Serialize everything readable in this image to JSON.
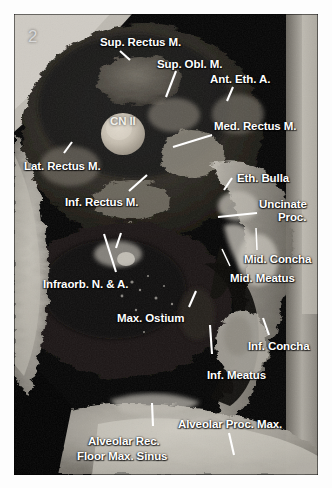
{
  "figure": {
    "number": "2",
    "caption_text": "",
    "plate": {
      "left": 14,
      "top": 14,
      "width": 304,
      "height": 461,
      "background_color": "#000000",
      "border_color": "#ffffff"
    }
  },
  "colors": {
    "label_text": "#ffffff",
    "leader_line": "#ffffff",
    "figure_number": "#d8d8d8",
    "page_background": "#ffffff",
    "dark_cavity": "#000000",
    "bone_light": "#c9c5bc",
    "soft_tissue_mid": "#6b6760",
    "optic_nerve": "#cfc8bb"
  },
  "labels": [
    {
      "id": "sup-rectus-m",
      "text": "Sup. Rectus M.",
      "x": 100,
      "y": 36,
      "align": "left"
    },
    {
      "id": "sup-obl-m",
      "text": "Sup. Obl. M.",
      "x": 157,
      "y": 58,
      "align": "left"
    },
    {
      "id": "ant-eth-a",
      "text": "Ant. Eth. A.",
      "x": 210,
      "y": 73,
      "align": "left"
    },
    {
      "id": "cn-ii",
      "text": "CN II",
      "x": 110,
      "y": 115,
      "align": "left"
    },
    {
      "id": "med-rectus-m",
      "text": "Med. Rectus M.",
      "x": 214,
      "y": 120,
      "align": "left"
    },
    {
      "id": "lat-rectus-m",
      "text": "Lat. Rectus M.",
      "x": 24,
      "y": 160,
      "align": "left"
    },
    {
      "id": "eth-bulla",
      "text": "Eth. Bulla",
      "x": 237,
      "y": 172,
      "align": "left"
    },
    {
      "id": "inf-rectus-m",
      "text": "Inf. Rectus M.",
      "x": 65,
      "y": 196,
      "align": "left"
    },
    {
      "id": "uncinate",
      "text": "Uncinate",
      "x": 259,
      "y": 198,
      "align": "left"
    },
    {
      "id": "proc",
      "text": "Proc.",
      "x": 278,
      "y": 211,
      "align": "left"
    },
    {
      "id": "mid-concha",
      "text": "Mid. Concha",
      "x": 244,
      "y": 253,
      "align": "left"
    },
    {
      "id": "mid-meatus",
      "text": "Mid. Meatus",
      "x": 230,
      "y": 272,
      "align": "left"
    },
    {
      "id": "infraorb-n-a",
      "text": "Infraorb. N. & A.",
      "x": 43,
      "y": 278,
      "align": "left"
    },
    {
      "id": "max-ostium",
      "text": "Max. Ostium",
      "x": 117,
      "y": 312,
      "align": "left"
    },
    {
      "id": "inf-concha",
      "text": "Inf. Concha",
      "x": 248,
      "y": 340,
      "align": "left"
    },
    {
      "id": "inf-meatus",
      "text": "Inf. Meatus",
      "x": 207,
      "y": 369,
      "align": "left"
    },
    {
      "id": "alveolar-proc-max",
      "text": "Alveolar Proc. Max.",
      "x": 178,
      "y": 418,
      "align": "left"
    },
    {
      "id": "alveolar-rec",
      "text": "Alveolar Rec.",
      "x": 88,
      "y": 435,
      "align": "left"
    },
    {
      "id": "floor-max-sinus",
      "text": "Floor Max. Sinus",
      "x": 77,
      "y": 450,
      "align": "left"
    }
  ],
  "leader_lines": [
    {
      "id": "leader-sup-rectus-m",
      "x1": 130,
      "y1": 60,
      "x2": 120,
      "y2": 51
    },
    {
      "id": "leader-sup-obl-m",
      "x1": 176,
      "y1": 71,
      "x2": 166,
      "y2": 97
    },
    {
      "id": "leader-ant-eth-a",
      "x1": 233,
      "y1": 87,
      "x2": 227,
      "y2": 101
    },
    {
      "id": "leader-med-rectus-m",
      "x1": 212,
      "y1": 135,
      "x2": 173,
      "y2": 147
    },
    {
      "id": "leader-lat-rectus-m",
      "x1": 72,
      "y1": 142,
      "x2": 64,
      "y2": 153
    },
    {
      "id": "leader-eth-bulla",
      "x1": 232,
      "y1": 178,
      "x2": 224,
      "y2": 190
    },
    {
      "id": "leader-inf-rectus-m",
      "x1": 147,
      "y1": 175,
      "x2": 129,
      "y2": 191
    },
    {
      "id": "leader-uncinate-proc",
      "x1": 257,
      "y1": 213,
      "x2": 218,
      "y2": 217
    },
    {
      "id": "leader-mid-concha",
      "x1": 256,
      "y1": 228,
      "x2": 257,
      "y2": 250
    },
    {
      "id": "leader-mid-meatus",
      "x1": 222,
      "y1": 249,
      "x2": 230,
      "y2": 266
    },
    {
      "id": "leader-infraorb-n-a-1",
      "x1": 104,
      "y1": 234,
      "x2": 116,
      "y2": 272
    },
    {
      "id": "leader-infraorb-n-a-2",
      "x1": 121,
      "y1": 233,
      "x2": 116,
      "y2": 248
    },
    {
      "id": "leader-max-ostium",
      "x1": 196,
      "y1": 291,
      "x2": 189,
      "y2": 307
    },
    {
      "id": "leader-inf-concha",
      "x1": 263,
      "y1": 318,
      "x2": 269,
      "y2": 335
    },
    {
      "id": "leader-inf-meatus",
      "x1": 210,
      "y1": 325,
      "x2": 212,
      "y2": 354
    },
    {
      "id": "leader-alveolar-rec",
      "x1": 152,
      "y1": 403,
      "x2": 153,
      "y2": 426
    },
    {
      "id": "leader-alveolar-proc-max",
      "x1": 229,
      "y1": 433,
      "x2": 234,
      "y2": 455
    }
  ]
}
